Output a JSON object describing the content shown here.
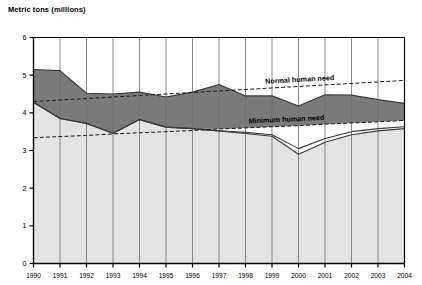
{
  "chart_data": {
    "type": "area",
    "title": "Metric tons (millions)",
    "xlabel": "",
    "ylabel": "Metric tons (millions)",
    "ylim": [
      0,
      6
    ],
    "yticks": [
      0,
      1,
      2,
      3,
      4,
      5,
      6
    ],
    "grid": "vertical",
    "legend_position": "inline-annotations",
    "categories": [
      1990,
      1991,
      1992,
      1993,
      1994,
      1995,
      1996,
      1997,
      1998,
      1999,
      2000,
      2001,
      2002,
      2003,
      2004
    ],
    "xtick_labels": [
      "1990",
      "1991",
      "1992",
      "1993",
      "1994",
      "1995",
      "1996",
      "1997",
      "1998",
      "1999",
      "2000",
      "2001",
      "2002",
      "2003",
      "2004"
    ],
    "series": [
      {
        "name": "Total supply",
        "style": "line-upper",
        "values": [
          5.15,
          5.12,
          4.52,
          4.5,
          4.55,
          4.42,
          4.55,
          4.75,
          4.45,
          4.45,
          4.18,
          4.48,
          4.47,
          4.35,
          4.25
        ]
      },
      {
        "name": "Dark band lower bound",
        "style": "line-middle",
        "values": [
          4.28,
          3.85,
          3.72,
          3.46,
          3.82,
          3.62,
          3.58,
          3.52,
          3.48,
          3.42,
          3.05,
          3.32,
          3.5,
          3.58,
          3.63
        ]
      },
      {
        "name": "Light area upper bound",
        "style": "line-lower",
        "values": [
          4.28,
          3.85,
          3.72,
          3.46,
          3.82,
          3.62,
          3.58,
          3.52,
          3.45,
          3.38,
          2.9,
          3.22,
          3.42,
          3.52,
          3.58
        ]
      }
    ],
    "reference_lines": [
      {
        "name": "Normal human need",
        "label": "Normal human need",
        "style": "dashed",
        "values": [
          4.3,
          4.34,
          4.38,
          4.42,
          4.46,
          4.5,
          4.54,
          4.58,
          4.62,
          4.66,
          4.7,
          4.74,
          4.78,
          4.82,
          4.86
        ]
      },
      {
        "name": "Minimum human need",
        "label": "Minimum human need",
        "style": "dashed",
        "values": [
          3.34,
          3.37,
          3.4,
          3.44,
          3.47,
          3.5,
          3.53,
          3.57,
          3.6,
          3.63,
          3.66,
          3.7,
          3.73,
          3.76,
          3.8
        ]
      }
    ],
    "colors": {
      "dark_band": "#7a7a7a",
      "light_band": "#e3e3e3",
      "line": "#3a3a3a",
      "axis": "#000000",
      "gridline": "#6f6f6f",
      "background": "#ffffff"
    }
  }
}
